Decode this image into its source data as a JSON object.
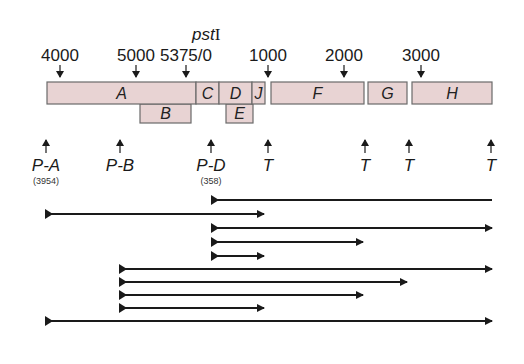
{
  "figure": {
    "enzyme_label": "pst",
    "enzyme_suffix": "I",
    "coordinates": [
      {
        "label": "4000",
        "x": 60
      },
      {
        "label": "5000",
        "x": 136
      },
      {
        "label": "5375/0",
        "x": 186
      },
      {
        "label": "1000",
        "x": 268
      },
      {
        "label": "2000",
        "x": 344
      },
      {
        "label": "3000",
        "x": 421
      }
    ],
    "genes_row1": [
      {
        "label": "A",
        "x1": 47,
        "x2": 196
      },
      {
        "label": "C",
        "x1": 196,
        "x2": 219
      },
      {
        "label": "D",
        "x1": 219,
        "x2": 252
      },
      {
        "label": "J",
        "x1": 252,
        "x2": 265
      },
      {
        "label": "F",
        "x1": 271,
        "x2": 364
      },
      {
        "label": "G",
        "x1": 368,
        "x2": 407
      },
      {
        "label": "H",
        "x1": 412,
        "x2": 492
      }
    ],
    "genes_row2": [
      {
        "label": "B",
        "x1": 140,
        "x2": 191
      },
      {
        "label": "E",
        "x1": 226,
        "x2": 253
      }
    ],
    "promoters": [
      {
        "label": "P-A",
        "sub": "(3954)",
        "x": 46
      },
      {
        "label": "P-B",
        "sub": "",
        "x": 120
      },
      {
        "label": "P-D",
        "sub": "(358)",
        "x": 211
      }
    ],
    "terminators": [
      {
        "label": "T",
        "x": 268
      },
      {
        "label": "T",
        "x": 365
      },
      {
        "label": "T",
        "x": 409
      },
      {
        "label": "T",
        "x": 491
      }
    ],
    "transcripts": [
      {
        "x1": 211,
        "x2": 492,
        "y": 200,
        "arrow": false
      },
      {
        "x1": 45,
        "x2": 264,
        "y": 214,
        "arrow": true
      },
      {
        "x1": 211,
        "x2": 492,
        "y": 228,
        "arrow": true
      },
      {
        "x1": 211,
        "x2": 363,
        "y": 242,
        "arrow": true
      },
      {
        "x1": 211,
        "x2": 264,
        "y": 256,
        "arrow": true
      },
      {
        "x1": 119,
        "x2": 492,
        "y": 269,
        "arrow": true
      },
      {
        "x1": 119,
        "x2": 407,
        "y": 282,
        "arrow": true
      },
      {
        "x1": 119,
        "x2": 363,
        "y": 295,
        "arrow": true
      },
      {
        "x1": 119,
        "x2": 264,
        "y": 308,
        "arrow": true
      },
      {
        "x1": 45,
        "x2": 492,
        "y": 321,
        "arrow": true
      }
    ]
  }
}
